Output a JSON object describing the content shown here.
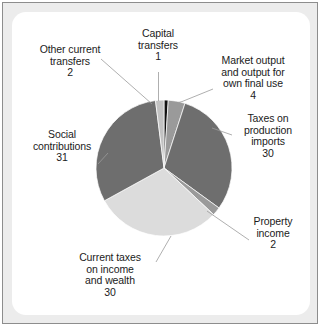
{
  "figure": {
    "background_color": "#ffffff",
    "panel_color": "#ffffff",
    "frame_color": "#ececec",
    "border_color": "#8d8d8d"
  },
  "chart_data": {
    "type": "pie",
    "title": "",
    "total": 100,
    "units": "%",
    "legend": "none (direct labels with leader lines)",
    "start_angle_deg": 0,
    "direction": "clockwise",
    "center": {
      "x": 164,
      "y": 168
    },
    "radius": 68,
    "categories": [
      "Capital transfers",
      "Market output and output for own final use",
      "Taxes on production imports",
      "Property income",
      "Current taxes on income and wealth",
      "Social contributions",
      "Other current transfers"
    ],
    "values": [
      1,
      4,
      30,
      2,
      30,
      31,
      2
    ],
    "colors": [
      "#111111",
      "#9a9a9a",
      "#6e6e6e",
      "#9a9a9a",
      "#dcdcdc",
      "#6e6e6e",
      "#c2c2c2"
    ],
    "slices": [
      {
        "label": "Capital transfers",
        "value": 1,
        "color": "#111111"
      },
      {
        "label": "Market output and output for own final use",
        "value": 4,
        "color": "#9a9a9a"
      },
      {
        "label": "Taxes on production imports",
        "value": 30,
        "color": "#6e6e6e"
      },
      {
        "label": "Property income",
        "value": 2,
        "color": "#9a9a9a"
      },
      {
        "label": "Current taxes on income and wealth",
        "value": 30,
        "color": "#dcdcdc"
      },
      {
        "label": "Social contributions",
        "value": 31,
        "color": "#6e6e6e"
      },
      {
        "label": "Other current transfers",
        "value": 2,
        "color": "#c2c2c2"
      }
    ]
  },
  "labels": {
    "capital_transfers": "Capital\ntransfers\n1",
    "market_output": "Market output\nand output for\nown final use\n4",
    "taxes_production": "Taxes on\nproduction\nimports\n30",
    "property_income": "Property\nincome\n2",
    "current_taxes": "Current taxes\non income\nand wealth\n30",
    "social_contributions": "Social\ncontributions\n31",
    "other_current_transfers": "Other current\ntransfers\n2"
  },
  "leader_line": {
    "color": "#9a9a9a",
    "width": 0.8
  }
}
